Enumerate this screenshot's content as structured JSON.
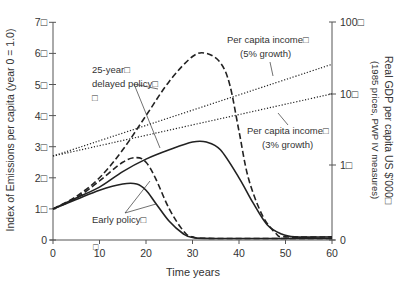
{
  "chart_data": {
    "type": "line",
    "title": "",
    "xlabel": "Time years",
    "ylabel_left": "Index of Emissions per capita (year 0 = 1.0)",
    "ylabel_right": "Real GDP per capita US $'000□",
    "ylabel_right_sub": "(1985 prices, PWP IV measures)",
    "xlim": [
      0,
      60
    ],
    "ylim_left": [
      0,
      7
    ],
    "x_ticks": [
      "0",
      "10",
      "20",
      "30",
      "40",
      "50",
      "60"
    ],
    "y_left_ticks": [
      "0",
      "1□",
      "2□",
      "3□",
      "4□",
      "5□",
      "6□",
      "7□"
    ],
    "y_right_ticks": [
      "0",
      "1□",
      "10□",
      "100□"
    ],
    "grid": false,
    "series": [
      {
        "name": "Early policy (5% growth)",
        "style": "dashed",
        "x": [
          0,
          5,
          10,
          15,
          18,
          20,
          22,
          25,
          28,
          30,
          35,
          60
        ],
        "values": [
          1.0,
          1.35,
          1.9,
          2.5,
          2.65,
          2.5,
          2.0,
          1.0,
          0.3,
          0.1,
          0.05,
          0.05
        ]
      },
      {
        "name": "Early policy (3% growth)",
        "style": "solid",
        "x": [
          0,
          5,
          10,
          15,
          18,
          20,
          22,
          25,
          28,
          30,
          35,
          60
        ],
        "values": [
          1.0,
          1.3,
          1.6,
          1.8,
          1.8,
          1.6,
          1.2,
          0.6,
          0.2,
          0.08,
          0.05,
          0.05
        ]
      },
      {
        "name": "25-year delayed policy (5% growth)",
        "style": "dashed",
        "x": [
          0,
          5,
          10,
          15,
          20,
          25,
          30,
          33,
          36,
          38,
          40,
          42,
          45,
          48,
          50,
          60
        ],
        "values": [
          1.0,
          1.4,
          2.0,
          2.9,
          4.0,
          5.1,
          5.9,
          6.0,
          5.7,
          5.0,
          3.5,
          2.0,
          0.8,
          0.2,
          0.1,
          0.1
        ]
      },
      {
        "name": "25-year delayed policy (3% growth)",
        "style": "solid",
        "x": [
          0,
          5,
          10,
          15,
          20,
          25,
          30,
          33,
          36,
          40,
          43,
          46,
          49,
          52,
          60
        ],
        "values": [
          1.0,
          1.35,
          1.7,
          2.2,
          2.6,
          2.9,
          3.15,
          3.15,
          2.9,
          2.0,
          1.2,
          0.5,
          0.2,
          0.1,
          0.1
        ]
      },
      {
        "name": "Per capita income (5% growth)",
        "style": "dotted",
        "axis": "right",
        "x": [
          0,
          60
        ],
        "values": [
          2.7,
          5.65
        ]
      },
      {
        "name": "Per capita income (3% growth)",
        "style": "dotted",
        "axis": "right",
        "x": [
          0,
          60
        ],
        "values": [
          2.7,
          4.7
        ]
      }
    ],
    "annotations": [
      {
        "text": "25-year□",
        "line2": "delayed policy□",
        "line3": "□"
      },
      {
        "text": "Early policy□"
      },
      {
        "text": "Per capita income□",
        "line2": "(5% growth)"
      },
      {
        "text": "Per capita income□",
        "line2": "(3% growth)"
      }
    ],
    "stray_marker": "□"
  }
}
